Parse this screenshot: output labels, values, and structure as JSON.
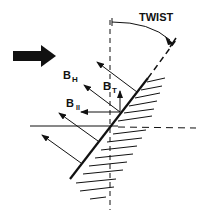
{
  "diagram": {
    "labels": {
      "twist": "TWIST",
      "b_h_main": "B",
      "b_h_sub": "H",
      "b_t_main": "B",
      "b_t_sub": "T",
      "b_par_main": "B",
      "b_par_sub": "II"
    },
    "colors": {
      "ink": "#111111",
      "background": "#ffffff"
    },
    "elements": [
      "incident-direction-arrow",
      "vertical-reference-axis",
      "horizontal-reference-axis",
      "tilted-surface",
      "twist-arc",
      "field-vector-arrows",
      "hatching"
    ]
  }
}
